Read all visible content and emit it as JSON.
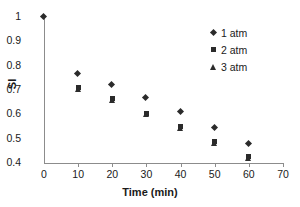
{
  "chart_data": {
    "type": "scatter",
    "title": "",
    "xlabel": "Time (min)",
    "ylabel": "SI",
    "xlim": [
      0,
      70
    ],
    "ylim": [
      0.4,
      1
    ],
    "xticks": [
      0,
      10,
      20,
      30,
      40,
      50,
      60,
      70
    ],
    "xtick_labels": [
      "0",
      "10",
      "20",
      "30",
      "40",
      "50",
      "60",
      "70"
    ],
    "yticks": [
      0.4,
      0.5,
      0.6,
      0.7,
      0.8,
      0.9,
      1
    ],
    "ytick_labels": [
      "0.4",
      "0.5",
      "0.6",
      "0.7",
      "0.8",
      "0.9",
      "1"
    ],
    "grid": false,
    "legend_position": "top-right",
    "marker_color": "#2b2b2b",
    "axis_color": "#8c8c8c",
    "series": [
      {
        "name": "1 atm",
        "marker": "diamond",
        "x": [
          0,
          10,
          20,
          30,
          40,
          50,
          60
        ],
        "values": [
          1.0,
          0.765,
          0.722,
          0.667,
          0.61,
          0.545,
          0.478
        ]
      },
      {
        "name": "2 atm",
        "marker": "square",
        "x": [
          10,
          20,
          30,
          40,
          50,
          60
        ],
        "values": [
          0.712,
          0.665,
          0.605,
          0.548,
          0.49,
          0.425
        ]
      },
      {
        "name": "3 atm",
        "marker": "triangle",
        "x": [
          10,
          20,
          30,
          40,
          50,
          60
        ],
        "values": [
          0.705,
          0.66,
          0.6,
          0.542,
          0.482,
          0.42
        ]
      }
    ]
  }
}
